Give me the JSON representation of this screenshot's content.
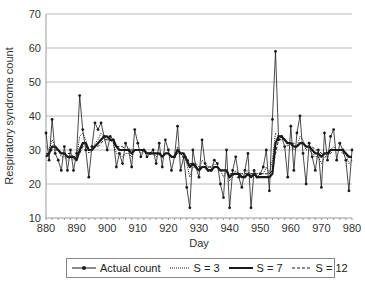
{
  "chart_data": {
    "type": "line",
    "title": "",
    "xlabel": "Day",
    "ylabel": "Respiratory syndrome count",
    "xlim": [
      880,
      980
    ],
    "ylim": [
      10,
      70
    ],
    "x_ticks": [
      880,
      890,
      900,
      910,
      920,
      930,
      940,
      950,
      960,
      970,
      980
    ],
    "y_ticks": [
      10,
      20,
      30,
      40,
      50,
      60,
      70
    ],
    "grid": "horizontal",
    "legend_position": "bottom",
    "x": [
      880,
      881,
      882,
      883,
      884,
      885,
      886,
      887,
      888,
      889,
      890,
      891,
      892,
      893,
      894,
      895,
      896,
      897,
      898,
      899,
      900,
      901,
      902,
      903,
      904,
      905,
      906,
      907,
      908,
      909,
      910,
      911,
      912,
      913,
      914,
      915,
      916,
      917,
      918,
      919,
      920,
      921,
      922,
      923,
      924,
      925,
      926,
      927,
      928,
      929,
      930,
      931,
      932,
      933,
      934,
      935,
      936,
      937,
      938,
      939,
      940,
      941,
      942,
      943,
      944,
      945,
      946,
      947,
      948,
      949,
      950,
      951,
      952,
      953,
      954,
      955,
      956,
      957,
      958,
      959,
      960,
      961,
      962,
      963,
      964,
      965,
      966,
      967,
      968,
      969,
      970,
      971,
      972,
      973,
      974,
      975,
      976,
      977,
      978,
      979,
      980
    ],
    "series": [
      {
        "name": "Actual count",
        "style": "solid-thin-markers",
        "values": [
          35,
          27,
          39,
          29,
          27,
          24,
          31,
          24,
          30,
          24,
          29,
          46,
          36,
          30,
          22,
          31,
          38,
          36,
          38,
          34,
          30,
          34,
          33,
          25,
          29,
          26,
          32,
          30,
          25,
          36,
          32,
          28,
          30,
          28,
          29,
          30,
          26,
          32,
          25,
          33,
          30,
          24,
          28,
          37,
          24,
          28,
          19,
          13,
          30,
          25,
          22,
          33,
          26,
          24,
          24,
          27,
          26,
          20,
          16,
          30,
          13,
          24,
          28,
          22,
          19,
          24,
          29,
          13,
          24,
          22,
          23,
          25,
          30,
          18,
          39,
          59,
          33,
          34,
          31,
          22,
          37,
          24,
          35,
          40,
          29,
          20,
          32,
          28,
          24,
          30,
          19,
          35,
          27,
          34,
          36,
          27,
          32,
          30,
          27,
          18,
          30
        ]
      },
      {
        "name": "S = 3",
        "style": "dotted",
        "values": [
          31,
          30,
          33,
          31,
          30,
          28,
          28,
          27,
          28,
          27,
          28,
          34,
          35,
          33,
          29,
          30,
          32,
          33,
          35,
          34,
          33,
          33,
          32,
          29,
          29,
          28,
          29,
          29,
          28,
          30,
          30,
          29,
          30,
          29,
          29,
          29,
          28,
          29,
          28,
          29,
          29,
          28,
          28,
          31,
          29,
          29,
          26,
          22,
          25,
          25,
          24,
          27,
          26,
          25,
          25,
          26,
          25,
          24,
          22,
          24,
          21,
          22,
          24,
          23,
          22,
          23,
          24,
          22,
          23,
          22,
          23,
          23,
          25,
          23,
          27,
          35,
          34,
          34,
          33,
          31,
          32,
          30,
          31,
          34,
          33,
          30,
          30,
          29,
          28,
          28,
          26,
          28,
          28,
          30,
          31,
          30,
          30,
          30,
          29,
          26,
          27
        ]
      },
      {
        "name": "S = 7",
        "style": "solid-thick",
        "values": [
          28,
          29,
          31,
          31,
          30,
          29,
          29,
          28,
          28,
          28,
          27,
          30,
          32,
          32,
          30,
          30,
          31,
          32,
          33,
          34,
          34,
          33,
          33,
          31,
          30,
          30,
          30,
          30,
          29,
          30,
          30,
          30,
          30,
          29,
          29,
          29,
          29,
          29,
          28,
          29,
          29,
          28,
          28,
          30,
          29,
          29,
          27,
          25,
          26,
          25,
          24,
          25,
          25,
          24,
          24,
          25,
          25,
          24,
          24,
          24,
          22,
          23,
          23,
          23,
          22,
          22,
          23,
          22,
          23,
          22,
          22,
          22,
          22,
          22,
          23,
          32,
          34,
          34,
          33,
          32,
          32,
          31,
          31,
          32,
          32,
          31,
          31,
          30,
          29,
          29,
          28,
          29,
          29,
          30,
          30,
          30,
          30,
          30,
          29,
          28,
          28
        ]
      },
      {
        "name": "S = 12",
        "style": "dashed",
        "values": [
          29,
          29,
          30,
          30,
          30,
          29,
          29,
          29,
          29,
          28,
          28,
          29,
          31,
          31,
          30,
          30,
          31,
          31,
          32,
          33,
          33,
          33,
          32,
          31,
          31,
          31,
          30,
          30,
          30,
          30,
          30,
          30,
          30,
          29,
          29,
          29,
          29,
          29,
          29,
          29,
          29,
          28,
          28,
          29,
          29,
          28,
          28,
          26,
          26,
          26,
          25,
          25,
          25,
          25,
          25,
          25,
          25,
          24,
          24,
          24,
          23,
          23,
          23,
          23,
          23,
          23,
          23,
          23,
          23,
          23,
          23,
          23,
          23,
          23,
          24,
          29,
          33,
          33,
          33,
          32,
          32,
          32,
          31,
          32,
          32,
          31,
          31,
          31,
          30,
          30,
          29,
          29,
          29,
          29,
          30,
          30,
          30,
          29,
          29,
          28,
          28
        ]
      }
    ]
  },
  "axes": {
    "xlabel": "Day",
    "ylabel": "Respiratory syndrome count"
  },
  "legend": {
    "items": [
      {
        "label": "Actual count",
        "icon": "line-with-dot-marker"
      },
      {
        "label": "S = 3",
        "icon": "dotted-line"
      },
      {
        "label": "S = 7",
        "icon": "thick-solid-line"
      },
      {
        "label": "S = 12",
        "icon": "dashed-line"
      }
    ]
  },
  "colors": {
    "line": "#1a1a1a",
    "grid": "#b8b8b8",
    "axis": "#999999",
    "text": "#333333"
  }
}
